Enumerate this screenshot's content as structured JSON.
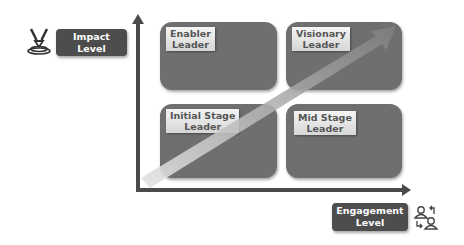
{
  "diagram": {
    "type": "2x2 matrix",
    "y_axis": {
      "label_line1": "Impact",
      "label_line2": "Level",
      "icon": "impact-target-icon"
    },
    "x_axis": {
      "label_line1": "Engagement",
      "label_line2": "Level",
      "icon": "people-exchange-icon"
    },
    "quadrants": [
      {
        "position": "top-left",
        "line1": "Enabler",
        "line2": "Leader"
      },
      {
        "position": "top-right",
        "line1": "Visionary",
        "line2": "Leader"
      },
      {
        "position": "bottom-left",
        "line1": "Initial Stage",
        "line2": "Leader"
      },
      {
        "position": "bottom-right",
        "line1": "Mid Stage",
        "line2": "Leader"
      }
    ],
    "trend_arrow": {
      "from": "bottom-left",
      "to": "top-right"
    },
    "colors": {
      "quadrant_fill": "#6f6f6f",
      "axis": "#4a4a4a",
      "label_box": "#4d4d4d",
      "label_tag": "#e6e6e6",
      "trend_arrow": "#8a8a8a"
    }
  }
}
